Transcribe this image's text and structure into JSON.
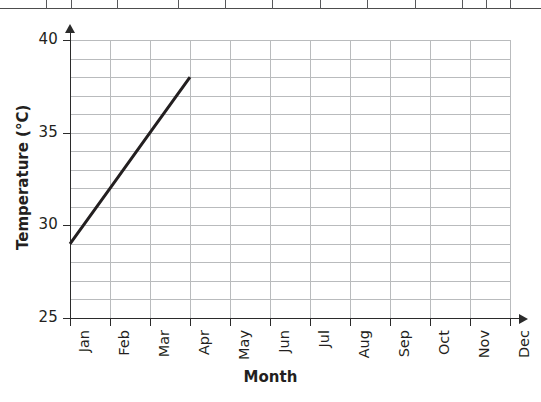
{
  "table_fragment": {
    "name": "partial-table-above-chart",
    "column_divider_positions": [
      46,
      71,
      117,
      178,
      225,
      272,
      320,
      367,
      415,
      462,
      486,
      510
    ]
  },
  "chart_data": {
    "type": "line",
    "title": "",
    "xlabel": "Month",
    "ylabel": "Temperature (°C)",
    "categories": [
      "Jan",
      "Feb",
      "Mar",
      "Apr",
      "May",
      "Jun",
      "Jul",
      "Aug",
      "Sep",
      "Oct",
      "Nov",
      "Dec"
    ],
    "series": [
      {
        "name": "Temperature",
        "x": [
          "Jan",
          "Feb",
          "Mar",
          "Apr"
        ],
        "values": [
          29,
          32,
          35,
          38
        ],
        "color": "#231f20",
        "line_width": 3
      }
    ],
    "ylim": [
      25,
      40
    ],
    "y_major_ticks": [
      25,
      30,
      35,
      40
    ],
    "y_major_tick_labels": [
      "25",
      "30",
      "35",
      "40"
    ],
    "y_minor_step": 1,
    "xlim": [
      "Jan",
      "Dec"
    ],
    "grid": true,
    "grid_color": "#b9bbbd",
    "axis_color": "#2b2b2b",
    "legend": null,
    "legend_position": "none",
    "x_tick_label_rotation": 90,
    "axis_arrows": true
  }
}
